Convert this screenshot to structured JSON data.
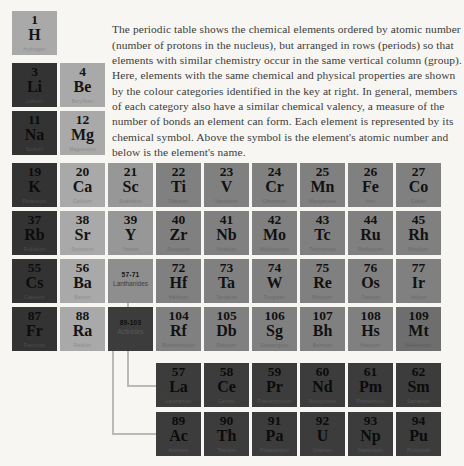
{
  "intro": {
    "text": "The periodic table shows the chemical elements ordered by atomic number (number of protons in the nucleus), but arranged in rows (periods) so that elements with similar chemistry occur in the same vertical column (group). Here, elements with the same chemical and physical properties are shown by the colour categories identified in the key at right. In general, members of each category also have a similar chemical valency, a measure of the number of bonds an element can form. Each element is represented by its chemical symbol. Above the symbol is the element's atomic number and below is the element's name."
  },
  "placeholders": {
    "lanthanides": {
      "range": "57-71",
      "label": "Lanthanides"
    },
    "actinides": {
      "range": "89-103",
      "label": "Actinides"
    }
  },
  "colors": {
    "background": "#f7f6f2",
    "alkali_metal": "#333333",
    "alkaline_earth": "#a9a9a9",
    "transition_metal": "#808080",
    "rare_earth": "#979797",
    "f_block": "#3c3c3c",
    "post_transition": "#6e6e6e",
    "connector_line": "#b9b9b9",
    "text": "#3b3b3b"
  },
  "elements": [
    {
      "number": "1",
      "symbol": "H",
      "name": "Hydrogen",
      "category": "c-alkaline",
      "x": 12,
      "y": 11
    },
    {
      "number": "3",
      "symbol": "Li",
      "name": "Lithium",
      "category": "c-alkali",
      "x": 12,
      "y": 63
    },
    {
      "number": "4",
      "symbol": "Be",
      "name": "Beryllium",
      "category": "c-alkaline",
      "x": 60,
      "y": 63
    },
    {
      "number": "11",
      "symbol": "Na",
      "name": "Sodium",
      "category": "c-alkali",
      "x": 12,
      "y": 111
    },
    {
      "number": "12",
      "symbol": "Mg",
      "name": "Magnesium",
      "category": "c-alkaline",
      "x": 60,
      "y": 111
    },
    {
      "number": "19",
      "symbol": "K",
      "name": "Potassium",
      "category": "c-alkali",
      "x": 12,
      "y": 163
    },
    {
      "number": "20",
      "symbol": "Ca",
      "name": "Calcium",
      "category": "c-alkaline",
      "x": 60,
      "y": 163
    },
    {
      "number": "21",
      "symbol": "Sc",
      "name": "Scandium",
      "category": "c-rare",
      "x": 108,
      "y": 163
    },
    {
      "number": "22",
      "symbol": "Ti",
      "name": "Titanium",
      "category": "c-transition",
      "x": 156,
      "y": 163
    },
    {
      "number": "23",
      "symbol": "V",
      "name": "Vanadium",
      "category": "c-transition",
      "x": 204,
      "y": 163
    },
    {
      "number": "24",
      "symbol": "Cr",
      "name": "Chromium",
      "category": "c-transition",
      "x": 252,
      "y": 163
    },
    {
      "number": "25",
      "symbol": "Mn",
      "name": "Manganese",
      "category": "c-transition",
      "x": 300,
      "y": 163
    },
    {
      "number": "26",
      "symbol": "Fe",
      "name": "Iron",
      "category": "c-transition",
      "x": 348,
      "y": 163
    },
    {
      "number": "27",
      "symbol": "Co",
      "name": "Cobalt",
      "category": "c-transition",
      "x": 396,
      "y": 163
    },
    {
      "number": "37",
      "symbol": "Rb",
      "name": "Rubidium",
      "category": "c-alkali",
      "x": 12,
      "y": 211
    },
    {
      "number": "38",
      "symbol": "Sr",
      "name": "Strontium",
      "category": "c-alkaline",
      "x": 60,
      "y": 211
    },
    {
      "number": "39",
      "symbol": "Y",
      "name": "Yttrium",
      "category": "c-rare",
      "x": 108,
      "y": 211
    },
    {
      "number": "40",
      "symbol": "Zr",
      "name": "Zirconium",
      "category": "c-transition",
      "x": 156,
      "y": 211
    },
    {
      "number": "41",
      "symbol": "Nb",
      "name": "Niobium",
      "category": "c-transition",
      "x": 204,
      "y": 211
    },
    {
      "number": "42",
      "symbol": "Mo",
      "name": "Molybdenum",
      "category": "c-transition",
      "x": 252,
      "y": 211
    },
    {
      "number": "43",
      "symbol": "Tc",
      "name": "Technetium",
      "category": "c-transition",
      "x": 300,
      "y": 211
    },
    {
      "number": "44",
      "symbol": "Ru",
      "name": "Ruthenium",
      "category": "c-transition",
      "x": 348,
      "y": 211
    },
    {
      "number": "45",
      "symbol": "Rh",
      "name": "Rhodium",
      "category": "c-transition",
      "x": 396,
      "y": 211
    },
    {
      "number": "55",
      "symbol": "Cs",
      "name": "Caesium",
      "category": "c-alkali",
      "x": 12,
      "y": 259
    },
    {
      "number": "56",
      "symbol": "Ba",
      "name": "Barium",
      "category": "c-alkaline",
      "x": 60,
      "y": 259
    },
    {
      "number": "72",
      "symbol": "Hf",
      "name": "Hafnium",
      "category": "c-transition",
      "x": 156,
      "y": 259
    },
    {
      "number": "73",
      "symbol": "Ta",
      "name": "Tantalum",
      "category": "c-transition",
      "x": 204,
      "y": 259
    },
    {
      "number": "74",
      "symbol": "W",
      "name": "Tungsten",
      "category": "c-transition",
      "x": 252,
      "y": 259
    },
    {
      "number": "75",
      "symbol": "Re",
      "name": "Rhenium",
      "category": "c-transition",
      "x": 300,
      "y": 259
    },
    {
      "number": "76",
      "symbol": "Os",
      "name": "Osmium",
      "category": "c-transition",
      "x": 348,
      "y": 259
    },
    {
      "number": "77",
      "symbol": "Ir",
      "name": "Iridium",
      "category": "c-transition",
      "x": 396,
      "y": 259
    },
    {
      "number": "87",
      "symbol": "Fr",
      "name": "Francium",
      "category": "c-alkali",
      "x": 12,
      "y": 307
    },
    {
      "number": "88",
      "symbol": "Ra",
      "name": "Radium",
      "category": "c-alkaline",
      "x": 60,
      "y": 307
    },
    {
      "number": "104",
      "symbol": "Rf",
      "name": "Rutherfordium",
      "category": "c-transition",
      "x": 156,
      "y": 307
    },
    {
      "number": "105",
      "symbol": "Db",
      "name": "Dubnium",
      "category": "c-transition",
      "x": 204,
      "y": 307
    },
    {
      "number": "106",
      "symbol": "Sg",
      "name": "Seaborgium",
      "category": "c-transition",
      "x": 252,
      "y": 307
    },
    {
      "number": "107",
      "symbol": "Bh",
      "name": "Bohrium",
      "category": "c-transition",
      "x": 300,
      "y": 307
    },
    {
      "number": "108",
      "symbol": "Hs",
      "name": "Hassium",
      "category": "c-transition",
      "x": 348,
      "y": 307
    },
    {
      "number": "109",
      "symbol": "Mt",
      "name": "Meitnerium",
      "category": "c-postmetal",
      "x": 396,
      "y": 307
    },
    {
      "number": "57",
      "symbol": "La",
      "name": "Lanthanum",
      "category": "c-fblock",
      "x": 156,
      "y": 363
    },
    {
      "number": "58",
      "symbol": "Ce",
      "name": "Cerium",
      "category": "c-fblock",
      "x": 204,
      "y": 363
    },
    {
      "number": "59",
      "symbol": "Pr",
      "name": "Praseodymium",
      "category": "c-fblock",
      "x": 252,
      "y": 363
    },
    {
      "number": "60",
      "symbol": "Nd",
      "name": "Neodymium",
      "category": "c-fblock",
      "x": 300,
      "y": 363
    },
    {
      "number": "61",
      "symbol": "Pm",
      "name": "Promethium",
      "category": "c-fblock",
      "x": 348,
      "y": 363
    },
    {
      "number": "62",
      "symbol": "Sm",
      "name": "Samarium",
      "category": "c-fblock",
      "x": 396,
      "y": 363
    },
    {
      "number": "89",
      "symbol": "Ac",
      "name": "Actinium",
      "category": "c-fblock",
      "x": 156,
      "y": 412
    },
    {
      "number": "90",
      "symbol": "Th",
      "name": "Thorium",
      "category": "c-fblock",
      "x": 204,
      "y": 412
    },
    {
      "number": "91",
      "symbol": "Pa",
      "name": "Protactinium",
      "category": "c-fblock",
      "x": 252,
      "y": 412
    },
    {
      "number": "92",
      "symbol": "U",
      "name": "Uranium",
      "category": "c-fblock",
      "x": 300,
      "y": 412
    },
    {
      "number": "93",
      "symbol": "Np",
      "name": "Neptunium",
      "category": "c-fblock",
      "x": 348,
      "y": 412
    },
    {
      "number": "94",
      "symbol": "Pu",
      "name": "Plutonium",
      "category": "c-fblock",
      "x": 396,
      "y": 412
    }
  ]
}
